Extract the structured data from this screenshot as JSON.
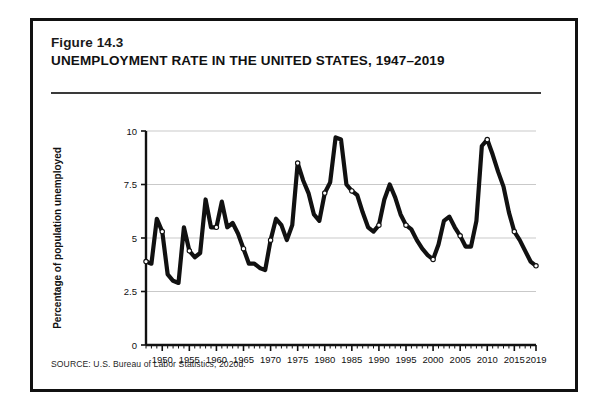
{
  "figure": {
    "number": "Figure 14.3",
    "title": "UNEMPLOYMENT RATE IN THE UNITED STATES, 1947–2019",
    "source": "SOURCE: U.S. Bureau of Labor Statistics, 2020d."
  },
  "colors": {
    "line": "#111111",
    "frame": "#111111",
    "grid": "#c9c9c9",
    "axis": "#111111",
    "marker_fill": "#ffffff",
    "background": "#ffffff"
  },
  "chart_data": {
    "type": "line",
    "title": "UNEMPLOYMENT RATE IN THE UNITED STATES, 1947–2019",
    "xlabel": "",
    "ylabel": "Percentage of population unemployed",
    "xlim": [
      1947,
      2019
    ],
    "ylim": [
      0,
      10
    ],
    "grid": true,
    "legend": "none",
    "y_ticks": [
      "0",
      "2.5",
      "5",
      "7.5",
      "10"
    ],
    "y_tick_values": [
      0,
      2.5,
      5,
      7.5,
      10
    ],
    "x_ticks": [
      "1950",
      "1955",
      "1960",
      "1965",
      "1970",
      "1975",
      "1980",
      "1985",
      "1990",
      "1995",
      "2000",
      "2005",
      "2010",
      "2015",
      "2019"
    ],
    "x_tick_values": [
      1950,
      1955,
      1960,
      1965,
      1970,
      1975,
      1980,
      1985,
      1990,
      1995,
      2000,
      2005,
      2010,
      2015,
      2019
    ],
    "x": [
      1947,
      1948,
      1949,
      1950,
      1951,
      1952,
      1953,
      1954,
      1955,
      1956,
      1957,
      1958,
      1959,
      1960,
      1961,
      1962,
      1963,
      1964,
      1965,
      1966,
      1967,
      1968,
      1969,
      1970,
      1971,
      1972,
      1973,
      1974,
      1975,
      1976,
      1977,
      1978,
      1979,
      1980,
      1981,
      1982,
      1983,
      1984,
      1985,
      1986,
      1987,
      1988,
      1989,
      1990,
      1991,
      1992,
      1993,
      1994,
      1995,
      1996,
      1997,
      1998,
      1999,
      2000,
      2001,
      2002,
      2003,
      2004,
      2005,
      2006,
      2007,
      2008,
      2009,
      2010,
      2011,
      2012,
      2013,
      2014,
      2015,
      2016,
      2017,
      2018,
      2019
    ],
    "values": [
      3.9,
      3.8,
      5.9,
      5.3,
      3.3,
      3.0,
      2.9,
      5.5,
      4.4,
      4.1,
      4.3,
      6.8,
      5.5,
      5.5,
      6.7,
      5.5,
      5.7,
      5.2,
      4.5,
      3.8,
      3.8,
      3.6,
      3.5,
      4.9,
      5.9,
      5.6,
      4.9,
      5.6,
      8.5,
      7.7,
      7.1,
      6.1,
      5.8,
      7.1,
      7.6,
      9.7,
      9.6,
      7.5,
      7.2,
      7.0,
      6.2,
      5.5,
      5.3,
      5.6,
      6.8,
      7.5,
      6.9,
      6.1,
      5.6,
      5.4,
      4.9,
      4.5,
      4.2,
      4.0,
      4.7,
      5.8,
      6.0,
      5.5,
      5.1,
      4.6,
      4.6,
      5.8,
      9.3,
      9.6,
      8.9,
      8.1,
      7.4,
      6.2,
      5.3,
      4.9,
      4.4,
      3.9,
      3.7
    ],
    "markers_at": [
      1947,
      1950,
      1955,
      1960,
      1965,
      1970,
      1975,
      1980,
      1985,
      1990,
      1995,
      2000,
      2005,
      2010,
      2015,
      2019
    ]
  }
}
